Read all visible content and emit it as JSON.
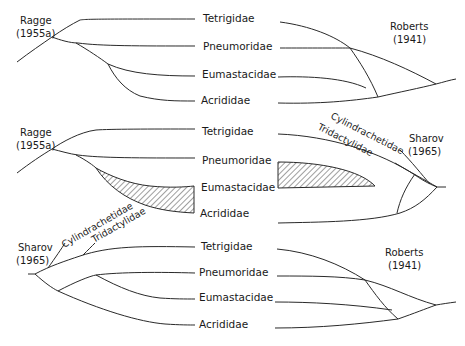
{
  "figure": {
    "families": [
      "Tetrigidae",
      "Pneumoridae",
      "Eumastacidae",
      "Acrididae"
    ],
    "extra_taxa": [
      "Cylindrachetidae",
      "Tridactylidae"
    ],
    "panels": [
      {
        "id": "top",
        "left_author": "Ragge",
        "left_year": "(1955a)",
        "right_author": "Roberts",
        "right_year": "(1941)",
        "labels": [
          "Tetrigidae",
          "Pneumoridae",
          "Eumastacidae",
          "Acrididae"
        ]
      },
      {
        "id": "middle",
        "left_author": "Ragge",
        "left_year": "(1955a)",
        "right_author": "Sharov",
        "right_year": "(1965)",
        "right_diagonal_1": "Cylindrachetidae",
        "right_diagonal_2": "Tridactylidae",
        "labels": [
          "Tetrigidae",
          "Pneumoridae",
          "Eumastacidae",
          "Acrididae"
        ],
        "hatched_region": "Eumastacidae–Acrididae (left), Pneumoridae–Eumastacidae (right)"
      },
      {
        "id": "bottom",
        "left_author": "Sharov",
        "left_year": "(1965)",
        "left_diagonal_1": "Cylindrachetidae",
        "left_diagonal_2": "Tridactylidae",
        "right_author": "Roberts",
        "right_year": "(1941)",
        "labels": [
          "Tetrigidae",
          "Pneumoridae",
          "Eumastacidae",
          "Acrididae"
        ]
      }
    ]
  },
  "colors": {
    "ink": "#2a2a2a",
    "background": "#ffffff"
  }
}
